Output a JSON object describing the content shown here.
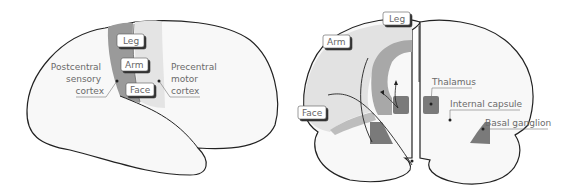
{
  "lateral_view": {
    "boxes": {
      "leg": "Leg",
      "arm": "Arm",
      "face": "Face"
    },
    "labels": {
      "postcentral": [
        "Postcentral",
        "sensory",
        "cortex"
      ],
      "precentral": [
        "Precentral",
        "motor",
        "cortex"
      ]
    }
  },
  "coronal_view": {
    "boxes": {
      "leg": "Leg",
      "arm": "Arm",
      "face": "Face"
    },
    "labels": {
      "thalamus": "Thalamus",
      "internal_capsule": "Internal capsule",
      "basal_ganglion": "Basal ganglion"
    }
  },
  "colors": {
    "outline": "#222222",
    "brain_fill": "#f8f8f8",
    "postcentral_band": "#9a9a9a",
    "precentral_band": "#e4e4e4",
    "dark_nucleus": "#7a7a7a",
    "corona_fill": "#e2e2e2"
  }
}
